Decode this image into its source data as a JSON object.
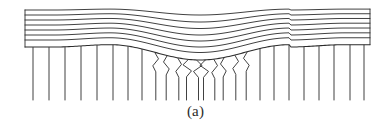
{
  "figure": {
    "caption": "(a)",
    "caption_name": "figure-label-a",
    "background_color": "#ffffff",
    "stroke_color": "#2b2b2b",
    "stroke_width": 0.9
  },
  "geometry": {
    "left_edge_x": 25,
    "right_edge_x": 370,
    "layers_top_y": 10,
    "layers_bottom_y": 47,
    "verticals_bottom_y": 100,
    "fold_center_x": 200,
    "fold_dip_depth": 13,
    "fold_left_rise_x": 110,
    "fold_right_rise_x": 290
  },
  "layers": {
    "count": 8,
    "name": "horizontal-strata-layer",
    "baseline_ys": [
      10,
      15,
      20,
      25,
      30,
      35,
      40,
      47
    ],
    "dip_amounts": [
      5,
      7,
      8.5,
      10,
      11,
      12,
      12.5,
      13
    ]
  },
  "verticals": {
    "name": "vertical-column-line",
    "count": 26,
    "x_positions": [
      33,
      49,
      65,
      81,
      97,
      113,
      128,
      142,
      155,
      167,
      178,
      188,
      197,
      205,
      214,
      224,
      235,
      247,
      260,
      274,
      289,
      304,
      319,
      334,
      350,
      364
    ],
    "kinked_indices": [
      8,
      9,
      10,
      11,
      12,
      13,
      14,
      15,
      16,
      17
    ],
    "strongly_kinked_indices": [
      11,
      12,
      13
    ]
  },
  "colors": {
    "line": "#2b2b2b",
    "line_light": "#4a4a4a",
    "background": "#ffffff",
    "caption": "#2b2b2b"
  }
}
